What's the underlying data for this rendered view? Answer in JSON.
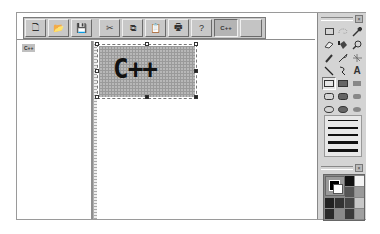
{
  "toolbar": {
    "buttons": [
      {
        "name": "new",
        "icon": "🗋"
      },
      {
        "name": "open",
        "icon": "📂"
      },
      {
        "name": "save",
        "icon": "💾"
      },
      {
        "name": "cut",
        "icon": "✂"
      },
      {
        "name": "copy",
        "icon": "⧉"
      },
      {
        "name": "paste",
        "icon": "📋"
      },
      {
        "name": "print",
        "icon": "🖶"
      },
      {
        "name": "help",
        "icon": "?"
      }
    ],
    "cpp_button_label": "C++",
    "blank_button_label": ""
  },
  "left_pane": {
    "items": [
      {
        "label": "C++"
      }
    ]
  },
  "canvas": {
    "image_text": "C++"
  },
  "tool_palette": {
    "close_label": "×",
    "tools": [
      "rectangle-select",
      "lasso-select",
      "eyedropper",
      "eraser",
      "fill-bucket",
      "magnifier",
      "pencil",
      "brush",
      "airbrush",
      "line",
      "curve",
      "text",
      "rectangle-outline",
      "rectangle-filled",
      "rectangle-filled-no-border",
      "rounded-rect-outline",
      "rounded-rect-filled",
      "rounded-rect-filled-no-border",
      "ellipse-outline",
      "ellipse-filled",
      "ellipse-filled-no-border"
    ],
    "text_tool_glyph": "A",
    "line_widths": [
      1,
      2,
      3,
      4,
      5
    ]
  },
  "color_palette": {
    "close_label": "×",
    "foreground": "#000000",
    "background": "#ffffff",
    "swatches": [
      "#111111",
      "#f4f4f4",
      "#555555",
      "#9a9a9a",
      "#222222",
      "#333333",
      "#444444",
      "#c8c8c8",
      "#2a2a2a",
      "#8a8a8a",
      "#3a3a3a",
      "#a0a0a0",
      "#0a0a0a",
      "#141414",
      "#1e1e1e",
      "#4a4a4a"
    ]
  }
}
